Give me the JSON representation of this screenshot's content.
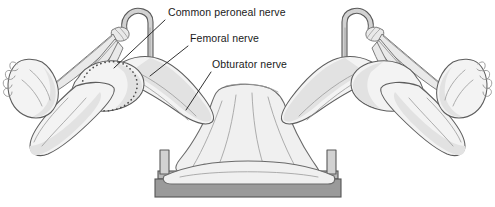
{
  "figure": {
    "background_color": "#ffffff",
    "width": 495,
    "height": 207,
    "style": "grayscale medical line drawing"
  },
  "labels": [
    {
      "id": "common-peroneal",
      "text": "Common peroneal nerve",
      "x": 168,
      "y": 16,
      "leader_from": [
        165,
        20
      ],
      "leader_to": [
        114,
        68
      ]
    },
    {
      "id": "femoral",
      "text": "Femoral nerve",
      "x": 190,
      "y": 42,
      "leader_from": [
        188,
        46
      ],
      "leader_to": [
        150,
        76
      ]
    },
    {
      "id": "obturator",
      "text": "Obturator nerve",
      "x": 212,
      "y": 68,
      "leader_from": [
        211,
        72
      ],
      "leader_to": [
        186,
        110
      ]
    }
  ],
  "anatomy": {
    "parts": [
      "left-leg",
      "right-leg",
      "left-foot",
      "right-foot",
      "left-thigh",
      "right-thigh",
      "perineal-drape",
      "dotted-nerve-path"
    ],
    "dotted_marking": "common peroneal nerve course over fibular head"
  },
  "equipment": {
    "left_stirrup": "candy-cane stirrup post with sling straps",
    "right_stirrup": "candy-cane stirrup post with sling straps",
    "table": "operating table base",
    "colors": {
      "skin": "#f3f3f3",
      "shade": "#e2e2e2",
      "outline": "#5d5d5d",
      "base_top": "#b8b8b8",
      "base_front": "#9a9a9a",
      "post": "#d2d2d2",
      "dotted_nerve": "#4a4a4a",
      "label_text": "#1a1a1a"
    }
  }
}
